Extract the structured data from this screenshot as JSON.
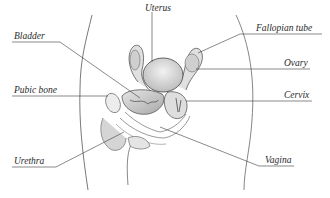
{
  "diagram": {
    "labels": {
      "uterus": "Uterus",
      "fallopian_tube": "Fallopian tube",
      "bladder": "Bladder",
      "ovary": "Ovary",
      "pubic_bone": "Pubic bone",
      "cervix": "Cervix",
      "urethra": "Urethra",
      "vagina": "Vagina"
    },
    "colors": {
      "line": "#3a3a3a",
      "text": "#2a2a2a",
      "tissue": "#d9d9d9",
      "background": "#ffffff"
    }
  }
}
